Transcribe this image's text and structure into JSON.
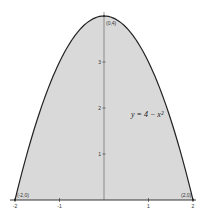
{
  "chart_data": {
    "type": "area",
    "title": "",
    "xlabel": "",
    "ylabel": "",
    "function": "y = 4 - x^2",
    "equation_label": "y = 4 − x²",
    "xlim": [
      -2,
      2
    ],
    "ylim": [
      0,
      4
    ],
    "grid": false,
    "legend": null,
    "x_ticks": [
      -2,
      -1,
      1,
      2
    ],
    "x_tick_labels": [
      "-2",
      "-1",
      "1",
      "2"
    ],
    "y_ticks": [
      1,
      2,
      3
    ],
    "y_tick_labels": [
      "1",
      "2",
      "3"
    ],
    "x": [
      -2,
      -1.5,
      -1,
      -0.5,
      0,
      0.5,
      1,
      1.5,
      2
    ],
    "y": [
      0,
      1.75,
      3,
      3.75,
      4,
      3.75,
      3,
      1.75,
      0
    ],
    "shaded_region": "area under curve from x = -2 to x = 2",
    "fill_color": "#d9d9d9",
    "curve_color": "#222222",
    "annotations": [
      {
        "text": "(0,4)",
        "x": 0,
        "y": 4
      },
      {
        "text": "(-2,0)",
        "x": -2,
        "y": 0
      },
      {
        "text": "(2,0)",
        "x": 2,
        "y": 0
      }
    ]
  }
}
